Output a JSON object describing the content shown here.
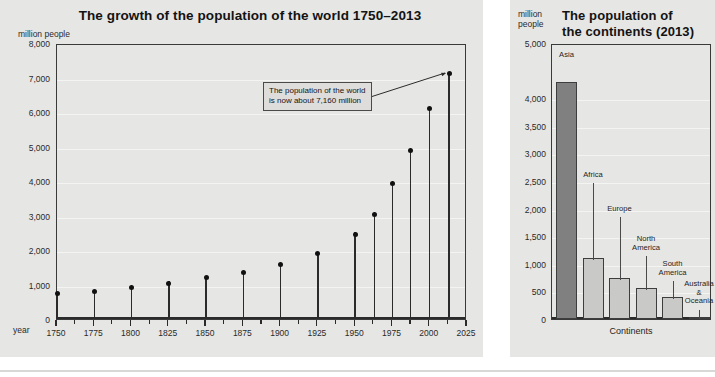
{
  "left_panel": {
    "title": "The growth of the population of the world 1750–2013",
    "y_unit": "million people",
    "x_unit": "year",
    "annotation": {
      "line1": "The population of the world",
      "line2": "is now about 7,160 million"
    }
  },
  "right_panel": {
    "title_line1": "The population of",
    "title_line2": "the continents (2013)",
    "y_unit_line1": "million",
    "y_unit_line2": "people",
    "x_axis_title": "Continents"
  },
  "chart_data": [
    {
      "type": "scatter",
      "id": "world-population-growth",
      "title": "The growth of the population of the world 1750–2013",
      "xlabel": "year",
      "ylabel": "million people",
      "xlim": [
        1750,
        2025
      ],
      "ylim": [
        0,
        8000
      ],
      "ytick_labels": [
        "0",
        "1,000",
        "2,000",
        "3,000",
        "4,000",
        "5,000",
        "6,000",
        "7,000",
        "8,000"
      ],
      "ytick_values": [
        0,
        1000,
        2000,
        3000,
        4000,
        5000,
        6000,
        7000,
        8000
      ],
      "xtick_labels": [
        "1750",
        "1775",
        "1800",
        "1825",
        "1850",
        "1875",
        "1900",
        "1925",
        "1950",
        "1975",
        "2000",
        "2025"
      ],
      "xtick_values": [
        1750,
        1775,
        1800,
        1825,
        1850,
        1875,
        1900,
        1925,
        1950,
        1975,
        2000,
        2025
      ],
      "grid": true,
      "legend": "none",
      "marker_style": "lollipop",
      "x": [
        1750,
        1775,
        1800,
        1825,
        1850,
        1875,
        1900,
        1925,
        1950,
        1963,
        1975,
        1987,
        2000,
        2013
      ],
      "values": [
        790,
        850,
        980,
        1100,
        1260,
        1400,
        1650,
        1950,
        2520,
        3100,
        4000,
        4950,
        6150,
        7160
      ],
      "annotations": [
        {
          "text": "The population of the world is now about 7,160 million",
          "points_to_x": 2013,
          "points_to_y": 7160
        }
      ]
    },
    {
      "type": "bar",
      "id": "continent-population-2013",
      "title": "The population of the continents (2013)",
      "xlabel": "Continents",
      "ylabel": "million people",
      "ylim": [
        0,
        5000
      ],
      "ytick_labels": [
        "0",
        "500",
        "1,000",
        "1,500",
        "2,000",
        "2,500",
        "3,000",
        "3,500",
        "4,000",
        "5,000"
      ],
      "ytick_values": [
        0,
        500,
        1000,
        1500,
        2000,
        2500,
        3000,
        3500,
        4000,
        5000
      ],
      "grid": true,
      "legend": "none",
      "categories": [
        "Asia",
        "Africa",
        "Europe",
        "North America",
        "South America",
        "Australia & Oceania"
      ],
      "values": [
        4300,
        1110,
        740,
        565,
        406,
        38
      ],
      "colors": [
        "#808080",
        "#c9c9c7",
        "#c9c9c7",
        "#c9c9c7",
        "#c9c9c7",
        "#c9c9c7"
      ]
    }
  ],
  "colors": {
    "panel_background": "#e6e6e4",
    "page_background": "#ffffff",
    "axis": "#2b2b2b",
    "gridline": "#f4f4f2",
    "marker": "#111111",
    "bar_highlight": "#808080",
    "bar_default": "#c9c9c7",
    "callout_background": "#dedddb"
  }
}
